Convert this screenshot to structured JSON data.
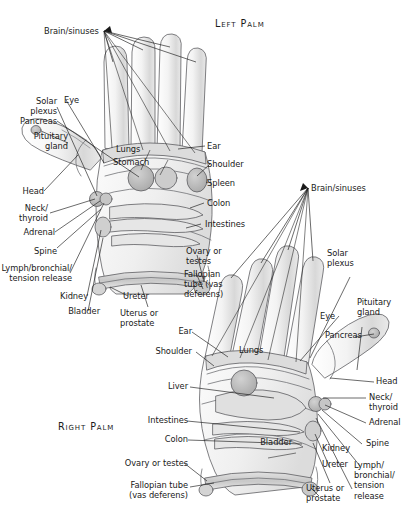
{
  "figure": {
    "kind": "reflexology-hand-chart",
    "background_color": "#ffffff",
    "ink_color": "#1a1a1a",
    "fill_light": "#e8e8e8",
    "fill_mid": "#cfcfcf",
    "fill_dark": "#b2b2b2"
  },
  "titles": {
    "left_palm": "Left Palm",
    "right_palm": "Right Palm"
  },
  "left_hand": {
    "labels": {
      "brain_sinuses": "Brain/sinuses",
      "solar_plexus": "Solar\nplexus",
      "pancreas": "Pancreas",
      "pituitary_gland": "Pituitary\ngland",
      "eye": "Eye",
      "lungs": "Lungs",
      "stomach": "Stomach",
      "ear": "Ear",
      "shoulder": "Shoulder",
      "spleen": "Spleen",
      "colon": "Colon",
      "intestines": "Intestines",
      "head": "Head",
      "neck_thyroid": "Neck/\nthyroid",
      "adrenal": "Adrenal",
      "spine": "Spine",
      "lymph_bronchial": "Lymph/bronchial/\ntension release",
      "kidney": "Kidney",
      "bladder": "Bladder",
      "ureter": "Ureter",
      "uterus_prostate": "Uterus or\nprostate",
      "ovary_testes": "Ovary or\ntestes",
      "fallopian_tube": "Fallopian\ntube (vas\ndeferens)"
    }
  },
  "right_hand": {
    "labels": {
      "brain_sinuses": "Brain/sinuses",
      "solar_plexus": "Solar\nplexus",
      "pituitary_gland": "Pituitary\ngland",
      "eye": "Eye",
      "pancreas": "Pancreas",
      "lungs": "Lungs",
      "ear": "Ear",
      "shoulder": "Shoulder",
      "liver": "Liver",
      "intestines": "Intestines",
      "colon": "Colon",
      "head": "Head",
      "neck_thyroid": "Neck/\nthyroid",
      "adrenal": "Adrenal",
      "spine": "Spine",
      "lymph_bronchial": "Lymph/\nbronchial/\ntension\nrelease",
      "bladder": "Bladder",
      "kidney": "Kidney",
      "ureter": "Ureter",
      "uterus_prostate": "Uterus or\nprostate",
      "ovary_testes": "Ovary or testes",
      "fallopian_tube": "Fallopian tube\n(vas deferens)"
    }
  }
}
